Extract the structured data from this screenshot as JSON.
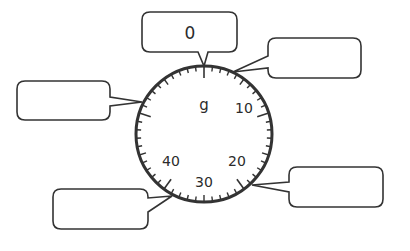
{
  "diagram": {
    "type": "scale-dial",
    "unit_label": "g",
    "dial_numbers": [
      "10",
      "20",
      "30",
      "40"
    ],
    "max_value": 50,
    "minor_tick_count": 50,
    "callouts": [
      {
        "id": "top",
        "value": "0"
      },
      {
        "id": "top-right",
        "value": ""
      },
      {
        "id": "left",
        "value": ""
      },
      {
        "id": "right",
        "value": ""
      },
      {
        "id": "bottom-left",
        "value": ""
      }
    ],
    "colors": {
      "stroke": "#333333",
      "background": "#ffffff"
    }
  }
}
